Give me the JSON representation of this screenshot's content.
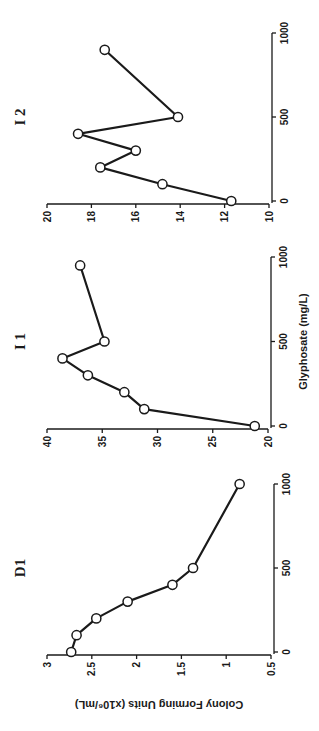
{
  "chart_data": [
    {
      "type": "line",
      "title": "D1",
      "xlabel": "",
      "ylabel": "Colony Forming Units (x10⁶/mL)",
      "x": [
        0,
        100,
        200,
        300,
        400,
        500,
        1000
      ],
      "series": [
        {
          "name": "D1",
          "values": [
            2.73,
            2.67,
            2.45,
            2.1,
            1.6,
            1.37,
            0.85
          ]
        }
      ],
      "xlim": [
        0,
        1000
      ],
      "ylim": [
        0.5,
        3
      ],
      "xticks": [
        0,
        500,
        1000
      ],
      "yticks": [
        0.5,
        1,
        1.5,
        2,
        2.5,
        3
      ],
      "ytick_labels": [
        "0.5",
        "1",
        "1.5",
        "2",
        "2.5",
        "3"
      ],
      "grid": false,
      "marker": "open-circle",
      "layout": {
        "x0": 79,
        "x1": 247,
        "yTop": 47,
        "yBottom": 271,
        "yAxisX": 76,
        "xAxisY": 274
      }
    },
    {
      "type": "line",
      "title": "I 1",
      "xlabel": "Glyphosate (mg/L)",
      "ylabel": "",
      "x": [
        0,
        100,
        200,
        300,
        400,
        500,
        950
      ],
      "series": [
        {
          "name": "I 1",
          "values": [
            21.2,
            31.2,
            33.0,
            36.3,
            38.6,
            34.8,
            37.0
          ]
        }
      ],
      "xlim": [
        0,
        1000
      ],
      "ylim": [
        20,
        40
      ],
      "xticks": [
        0,
        500,
        1000
      ],
      "yticks": [
        20,
        25,
        30,
        35,
        40
      ],
      "ytick_labels": [
        "20",
        "25",
        "30",
        "35",
        "40"
      ],
      "grid": false,
      "marker": "open-circle",
      "layout": {
        "x0": 305,
        "x1": 474,
        "yTop": 47,
        "yBottom": 268,
        "yAxisX": 302,
        "xAxisY": 271
      }
    },
    {
      "type": "line",
      "title": "I 2",
      "xlabel": "",
      "ylabel": "",
      "x": [
        0,
        100,
        200,
        300,
        400,
        500,
        900
      ],
      "series": [
        {
          "name": "I 2",
          "values": [
            11.7,
            14.8,
            17.6,
            16.0,
            18.6,
            14.1,
            17.4
          ]
        }
      ],
      "xlim": [
        0,
        1000
      ],
      "ylim": [
        10,
        20
      ],
      "xticks": [
        0,
        500,
        1000
      ],
      "yticks": [
        10,
        12,
        14,
        16,
        18,
        20
      ],
      "ytick_labels": [
        "10",
        "12",
        "14",
        "16",
        "18",
        "20"
      ],
      "grid": false,
      "marker": "open-circle",
      "layout": {
        "x0": 530,
        "x1": 698,
        "yTop": 47,
        "yBottom": 269,
        "yAxisX": 527,
        "xAxisY": 272
      }
    }
  ],
  "figure": {
    "shared_xlabel": "Glyphosate (mg/L)",
    "shared_ylabel": "Colony Forming Units (x10⁶/mL)",
    "orientation": "rotated 90° counter-clockwise"
  }
}
